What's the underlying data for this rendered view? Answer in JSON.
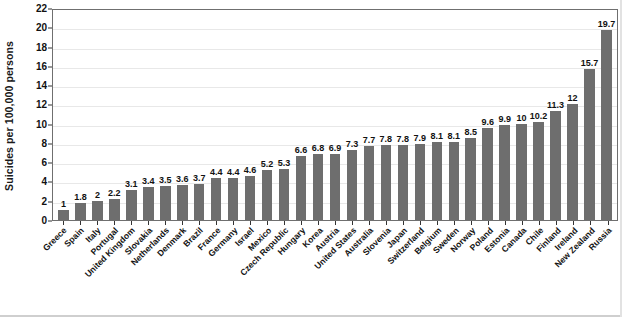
{
  "chart_data": {
    "type": "bar",
    "title": "",
    "xlabel": "",
    "ylabel": "Suicides per 100,000 persons",
    "ylim": [
      0,
      22
    ],
    "ytick_step": 2,
    "yticks": [
      0,
      2,
      4,
      6,
      8,
      10,
      12,
      14,
      16,
      18,
      20,
      22
    ],
    "ytick_labels": [
      "0",
      "2",
      "4",
      "6",
      "8",
      "10",
      "12",
      "14",
      "16",
      "18",
      "20",
      "22"
    ],
    "grid": true,
    "grid_axis": "y",
    "legend": "none",
    "bar_color": "#6e6e6e",
    "value_labels": true,
    "categories": [
      "Greece",
      "Spain",
      "Italy",
      "Portugal",
      "United Kingdom",
      "Slovakia",
      "Netherlands",
      "Denmark",
      "Brazil",
      "France",
      "Germany",
      "Israel",
      "Mexico",
      "Czech Republic",
      "Hungary",
      "Korea",
      "Austria",
      "United States",
      "Australia",
      "Slovenia",
      "Japan",
      "Switzerland",
      "Belgium",
      "Sweden",
      "Norway",
      "Poland",
      "Estonia",
      "Canada",
      "Chile",
      "Finland",
      "Ireland",
      "New Zealand",
      "Russia"
    ],
    "values": [
      1,
      1.8,
      2,
      2.2,
      3.1,
      3.4,
      3.5,
      3.6,
      3.7,
      4.4,
      4.4,
      4.6,
      5.2,
      5.3,
      6.6,
      6.8,
      6.9,
      7.3,
      7.7,
      7.8,
      7.8,
      7.9,
      8.1,
      8.1,
      8.5,
      9.6,
      9.9,
      10,
      10.2,
      11.3,
      12,
      15.7,
      19.7
    ],
    "value_label_texts": [
      "1",
      "1.8",
      "2",
      "2.2",
      "3.1",
      "3.4",
      "3.5",
      "3.6",
      "3.7",
      "4.4",
      "4.4",
      "4.6",
      "5.2",
      "5.3",
      "6.6",
      "6.8",
      "6.9",
      "7.3",
      "7.7",
      "7.8",
      "7.8",
      "7.9",
      "8.1",
      "8.1",
      "8.5",
      "9.6",
      "9.9",
      "10",
      "10.2",
      "11.3",
      "12",
      "15.7",
      "19.7"
    ]
  }
}
